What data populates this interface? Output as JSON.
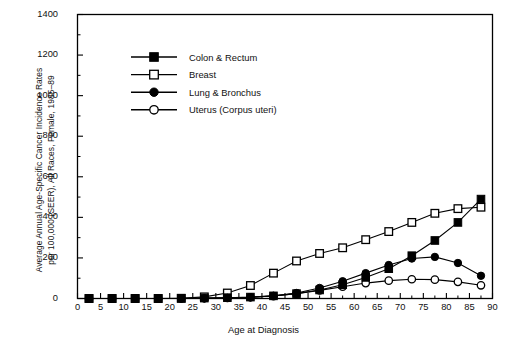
{
  "chart_data": {
    "type": "line",
    "title": "",
    "xlabel": "Age at Diagnosis",
    "ylabel_lines": [
      "Average Annual Age-Specific Cancer Incidence Rates",
      "per 100,000 (SEER), All Races, Female, 1985–89"
    ],
    "xlim": [
      0,
      90
    ],
    "ylim": [
      0,
      1400
    ],
    "xticks": [
      0,
      5,
      10,
      15,
      20,
      25,
      30,
      35,
      40,
      45,
      50,
      55,
      60,
      65,
      70,
      75,
      80,
      85,
      90
    ],
    "yticks": [
      0,
      200,
      400,
      600,
      800,
      1000,
      1200,
      1400
    ],
    "y_minor_step": 100,
    "grid": false,
    "legend_position": "upper-left-inside",
    "x": [
      2.5,
      7.5,
      12.5,
      17.5,
      22.5,
      27.5,
      32.5,
      37.5,
      42.5,
      47.5,
      52.5,
      57.5,
      62.5,
      67.5,
      72.5,
      77.5,
      82.5,
      87.5
    ],
    "series": [
      {
        "name": "Colon & Rectum",
        "marker": "filled-square",
        "color": "#000000",
        "values": [
          0,
          0,
          0,
          0,
          1,
          2,
          4,
          7,
          13,
          24,
          42,
          68,
          104,
          147,
          211,
          286,
          375,
          490
        ]
      },
      {
        "name": "Breast",
        "marker": "open-square",
        "color": "#000000",
        "values": [
          0,
          0,
          0,
          0,
          1,
          8,
          27,
          64,
          125,
          185,
          222,
          250,
          290,
          330,
          375,
          420,
          443,
          450
        ]
      },
      {
        "name": "Lung & Bronchus",
        "marker": "filled-circle",
        "color": "#000000",
        "values": [
          0,
          0,
          0,
          0,
          0,
          1,
          3,
          6,
          13,
          27,
          52,
          85,
          125,
          165,
          197,
          205,
          175,
          112
        ]
      },
      {
        "name": "Uterus (Corpus uteri)",
        "marker": "open-circle",
        "color": "#000000",
        "values": [
          0,
          0,
          0,
          0,
          0,
          1,
          3,
          6,
          12,
          24,
          40,
          58,
          76,
          88,
          95,
          93,
          82,
          65
        ]
      }
    ]
  },
  "legend": {
    "items": [
      {
        "label": "Colon & Rectum"
      },
      {
        "label": "Breast"
      },
      {
        "label": "Lung & Bronchus"
      },
      {
        "label": "Uterus (Corpus uteri)"
      }
    ]
  },
  "axes": {
    "x_tick_labels": [
      "0",
      "5",
      "10",
      "15",
      "20",
      "25",
      "30",
      "35",
      "40",
      "45",
      "50",
      "55",
      "60",
      "65",
      "70",
      "75",
      "80",
      "85",
      "90"
    ],
    "y_tick_labels": [
      "0",
      "200",
      "400",
      "600",
      "800",
      "1000",
      "1200",
      "1400"
    ]
  }
}
